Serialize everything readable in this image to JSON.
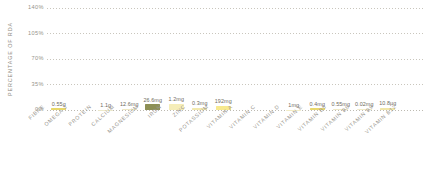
{
  "chart_data": {
    "type": "bar",
    "title": "",
    "xlabel": "",
    "ylabel": "PERCENTAGE OF RDA",
    "ylim": [
      0,
      140
    ],
    "yticks": [
      "0%",
      "35%",
      "70%",
      "105%",
      "140%"
    ],
    "ytick_values": [
      0,
      35,
      70,
      105,
      140
    ],
    "grid": true,
    "legend": "none",
    "categories": [
      "FIBRE",
      "OMEGA 3",
      "PROTEIN",
      "CALCIUM",
      "MAGNESIUM",
      "IRON",
      "ZINC",
      "POTASSIUM",
      "VITAMIN A",
      "VITAMIN C",
      "VITAMIN D",
      "VITAMIN E",
      "VITAMIN B5",
      "VITAMIN B6",
      "VITAMIN B9",
      "VITAMIN B12"
    ],
    "data_labels": [
      "0.55g",
      "",
      "1.1g",
      "12.6mg",
      "26.6mg",
      "1.2mg",
      "0.3mg",
      "192mg",
      "",
      "",
      "1mg",
      "0.4mg",
      "0.55mg",
      "0.02mg",
      "10.8µg",
      ""
    ],
    "values": [
      2.2,
      0,
      0.6,
      0.9,
      7.6,
      8.6,
      2.7,
      5.5,
      0,
      0,
      0.6,
      2.2,
      1.0,
      1.3,
      2.7,
      0
    ],
    "bar_colors": [
      "#e8d86a",
      "#f3efd2",
      "#eeeacb",
      "#efe9c4",
      "#8d8f55",
      "#f5edb8",
      "#f2e9ae",
      "#f7e98f",
      "#f5f2dd",
      "#f5f2dd",
      "#f2ecc6",
      "#e9d86e",
      "#efe9c6",
      "#f1ebc9",
      "#f0e6a8",
      "#f5f2dd"
    ]
  },
  "axis": {
    "y_title": "PERCENTAGE OF RDA"
  },
  "colors": {
    "grid": "#c9c6bd",
    "axis_text": "#96938a",
    "label_text": "#9c9890",
    "value_text": "#6e6a60",
    "accent_olive": "#8d8f55",
    "accent_yellow": "#e8d86a",
    "background": "#ffffff"
  }
}
